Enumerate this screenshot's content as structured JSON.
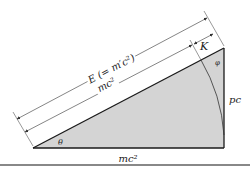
{
  "diagram": {
    "type": "relativistic-energy-triangle",
    "labels": {
      "total_energy": "E (= m′c²)",
      "rest_energy_hyp": "mc²",
      "kinetic": "K",
      "momentum": "pc",
      "rest_energy_base": "mc²",
      "angle_theta": "θ",
      "angle_phi": "φ"
    },
    "colors": {
      "fill": "#d4d4d4",
      "stroke": "#1a1a1a",
      "line": "#333333"
    }
  }
}
